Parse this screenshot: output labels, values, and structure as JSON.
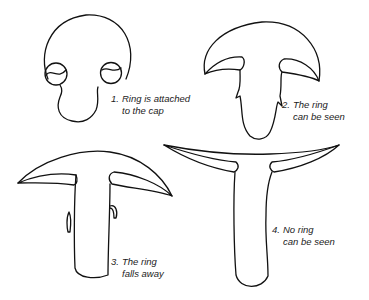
{
  "diagram": {
    "type": "mushroom-ring-stages",
    "stroke_color": "#111111",
    "background": "#ffffff",
    "stages": [
      {
        "number": "1.",
        "line1": "Ring is attached",
        "line2": "to the cap"
      },
      {
        "number": "2.",
        "line1": "The ring",
        "line2": "can be seen"
      },
      {
        "number": "3.",
        "line1": "The ring",
        "line2": "falls away"
      },
      {
        "number": "4.",
        "line1": "No ring",
        "line2": "can be seen"
      }
    ]
  }
}
